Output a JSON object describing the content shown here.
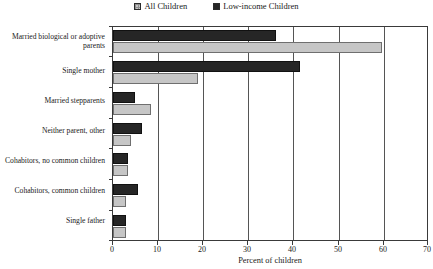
{
  "chart_data": {
    "type": "bar",
    "orientation": "horizontal",
    "title": "",
    "xlabel": "Percent of children",
    "ylabel": "",
    "xlim": [
      0,
      70
    ],
    "xticks": [
      0,
      10,
      20,
      30,
      40,
      50,
      60,
      70
    ],
    "grid": "vertical",
    "legend_position": "top-center",
    "categories": [
      "Married biological or adoptive parents",
      "Single mother",
      "Married stepparents",
      "Neither parent, other",
      "Cohabitors, no common children",
      "Cohabitors, common children",
      "Single father"
    ],
    "series": [
      {
        "name": "All Children",
        "color": "#c6c6c6",
        "values": [
          60,
          19,
          8.5,
          4,
          3.3,
          3,
          3
        ]
      },
      {
        "name": "Low-income Children",
        "color": "#262626",
        "values": [
          36.4,
          41.7,
          5,
          6.5,
          3.3,
          5.5,
          3
        ]
      }
    ]
  },
  "legend": {
    "entries": [
      {
        "label": "All Children"
      },
      {
        "label": "Low-income Children"
      }
    ]
  },
  "axis": {
    "x_title": "Percent of children",
    "x_tick_labels": [
      "0",
      "10",
      "20",
      "30",
      "40",
      "50",
      "60",
      "70"
    ]
  },
  "categories": [
    {
      "label": "Married biological or adoptive parents"
    },
    {
      "label": "Single mother"
    },
    {
      "label": "Married stepparents"
    },
    {
      "label": "Neither parent, other"
    },
    {
      "label": "Cohabitors, no common children"
    },
    {
      "label": "Cohabitors, common children"
    },
    {
      "label": "Single father"
    }
  ]
}
